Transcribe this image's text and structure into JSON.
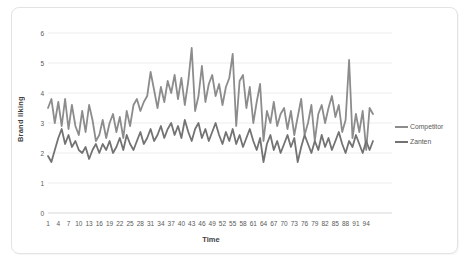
{
  "figure": {
    "background": "#ffffff",
    "border_color": "#e3e3e3"
  },
  "axis": {
    "tick_label_color": "#595959",
    "gridline_color": "#ededed",
    "baseline_color": "#d6d6d6"
  },
  "chart_data": {
    "type": "line",
    "title": "",
    "xlabel": "Time",
    "ylabel": "Brand liking",
    "x_start": 1,
    "x_end": 96,
    "x_tick_labels": [
      "1",
      "4",
      "7",
      "10",
      "13",
      "16",
      "19",
      "22",
      "25",
      "28",
      "31",
      "34",
      "37",
      "40",
      "43",
      "46",
      "49",
      "52",
      "55",
      "58",
      "61",
      "64",
      "67",
      "70",
      "73",
      "76",
      "79",
      "82",
      "85",
      "88",
      "91",
      "94"
    ],
    "x_tick_step": 3,
    "ylim": [
      0,
      6
    ],
    "y_ticks": [
      0,
      1,
      2,
      3,
      4,
      5,
      6
    ],
    "grid": "horizontal",
    "legend_position": "right",
    "series": [
      {
        "name": "Competitor",
        "color": "#8c8c8c",
        "values": [
          3.5,
          3.8,
          3.0,
          3.7,
          2.9,
          3.8,
          2.8,
          3.6,
          2.9,
          2.6,
          3.4,
          2.7,
          3.6,
          3.1,
          2.4,
          2.6,
          3.1,
          2.5,
          3.0,
          3.3,
          2.7,
          3.2,
          2.5,
          3.4,
          2.9,
          3.6,
          3.8,
          3.4,
          3.7,
          3.9,
          4.7,
          4.1,
          3.5,
          4.2,
          3.7,
          4.4,
          4.0,
          4.6,
          3.8,
          4.5,
          3.6,
          4.4,
          5.5,
          3.4,
          3.9,
          4.9,
          3.7,
          4.3,
          4.6,
          3.9,
          4.3,
          3.6,
          4.2,
          4.5,
          5.3,
          2.9,
          4.4,
          4.6,
          3.5,
          4.2,
          3.0,
          3.7,
          4.3,
          2.4,
          3.4,
          3.0,
          3.7,
          2.9,
          3.3,
          3.5,
          2.8,
          3.4,
          2.6,
          3.2,
          3.8,
          2.6,
          3.0,
          3.6,
          2.4,
          3.3,
          3.6,
          3.0,
          3.5,
          3.9,
          3.2,
          3.6,
          2.7,
          3.1,
          5.1,
          2.5,
          3.3,
          2.7,
          3.4,
          2.1,
          3.5,
          3.3
        ]
      },
      {
        "name": "Zanten",
        "color": "#737373",
        "values": [
          1.9,
          1.7,
          2.1,
          2.5,
          2.8,
          2.3,
          2.6,
          2.2,
          2.4,
          2.1,
          2.0,
          2.2,
          1.8,
          2.1,
          2.3,
          2.0,
          2.3,
          2.1,
          2.4,
          2.0,
          2.2,
          2.5,
          2.1,
          2.6,
          2.3,
          2.1,
          2.4,
          2.7,
          2.3,
          2.5,
          2.8,
          2.4,
          2.6,
          2.9,
          2.5,
          2.8,
          3.0,
          2.6,
          2.9,
          2.5,
          3.1,
          2.7,
          2.4,
          2.8,
          3.0,
          2.5,
          2.8,
          2.4,
          2.7,
          3.0,
          2.6,
          2.3,
          2.7,
          2.4,
          2.8,
          2.3,
          2.6,
          2.2,
          2.5,
          2.8,
          2.4,
          2.1,
          2.5,
          1.7,
          2.3,
          2.6,
          2.1,
          2.4,
          2.0,
          2.3,
          2.6,
          2.2,
          2.5,
          1.7,
          2.2,
          2.6,
          2.3,
          2.0,
          2.4,
          2.1,
          2.6,
          2.2,
          2.5,
          2.1,
          2.4,
          2.7,
          2.3,
          2.0,
          2.4,
          2.2,
          2.6,
          2.3,
          2.0,
          2.4,
          2.1,
          2.4
        ]
      }
    ]
  }
}
